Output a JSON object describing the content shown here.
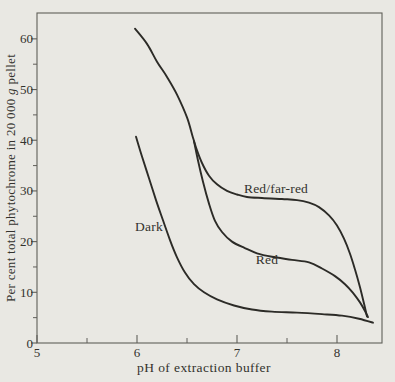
{
  "figure_title": "",
  "colors": {
    "background": "#e9e8e3",
    "axis": "#605f5a",
    "curve": "#2c2b27",
    "text": "#33322d"
  },
  "chart_data": {
    "type": "line",
    "title": "",
    "xlabel": "pH of extraction buffer",
    "ylabel": "Per cent total phytochrome in 20 000 g pellet",
    "ylabel_parts": {
      "pre": "Per cent total phytochrome in 20 000 ",
      "italic_g": "g",
      "post": " pellet"
    },
    "xlim": [
      5,
      8.45
    ],
    "ylim": [
      0,
      65.1
    ],
    "grid": false,
    "legend": "inline-labels",
    "x_major_ticks": [
      5,
      6,
      7,
      8
    ],
    "x_minor_ticks": [
      5.5,
      6.5,
      7.5
    ],
    "y_major_ticks": [
      0,
      10,
      20,
      30,
      40,
      50,
      60
    ],
    "y_minor_ticks": [
      5,
      15,
      25,
      35,
      45,
      55
    ],
    "plot_px": {
      "left": 37,
      "top": 13,
      "right": 382,
      "bottom": 343
    },
    "series": [
      {
        "name": "Red/far-red",
        "x": [
          5.98,
          6.1,
          6.2,
          6.3,
          6.4,
          6.5,
          6.56,
          6.6,
          6.65,
          6.72,
          6.8,
          6.9,
          7.0,
          7.1,
          7.25,
          7.45,
          7.6,
          7.72,
          7.82,
          7.92,
          8.0,
          8.07,
          8.13,
          8.18,
          8.23,
          8.27,
          8.3
        ],
        "y": [
          62.0,
          59.0,
          55.5,
          52.5,
          49.0,
          44.5,
          40.5,
          38.0,
          35.5,
          33.0,
          31.3,
          30.0,
          29.3,
          28.8,
          28.6,
          28.4,
          28.2,
          27.7,
          26.8,
          25.2,
          23.2,
          20.6,
          17.6,
          14.5,
          11.0,
          7.8,
          5.2
        ]
      },
      {
        "name": "Red",
        "x": [
          6.57,
          6.61,
          6.66,
          6.72,
          6.78,
          6.85,
          6.95,
          7.07,
          7.2,
          7.35,
          7.55,
          7.72,
          7.85,
          7.98,
          8.08,
          8.16,
          8.23,
          8.28,
          8.31
        ],
        "y": [
          39.8,
          36.0,
          31.8,
          27.5,
          24.1,
          21.9,
          20.0,
          18.8,
          17.7,
          17.0,
          16.4,
          15.9,
          14.7,
          13.2,
          11.6,
          9.9,
          8.0,
          6.3,
          5.1
        ]
      },
      {
        "name": "Dark",
        "x": [
          5.99,
          6.05,
          6.12,
          6.19,
          6.26,
          6.33,
          6.4,
          6.48,
          6.57,
          6.67,
          6.8,
          6.97,
          7.15,
          7.35,
          7.6,
          7.85,
          8.05,
          8.22,
          8.36
        ],
        "y": [
          40.7,
          36.8,
          32.5,
          28.2,
          24.2,
          20.3,
          16.9,
          13.9,
          11.6,
          10.0,
          8.6,
          7.4,
          6.6,
          6.2,
          6.0,
          5.7,
          5.4,
          4.8,
          4.0
        ]
      }
    ],
    "annotations": [
      {
        "text": "Red/far-red",
        "x": 7.39,
        "y": 30.4
      },
      {
        "text": "Red",
        "x": 7.3,
        "y": 16.4
      },
      {
        "text": "Dark",
        "x": 6.12,
        "y": 22.9
      }
    ]
  }
}
